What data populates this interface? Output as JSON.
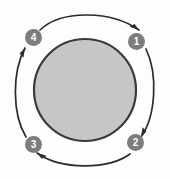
{
  "diagram": {
    "type": "cyclical-process-diagram",
    "title": "",
    "background_color": "#fdfdfd",
    "center": {
      "shape": "circle",
      "label": "",
      "fill_color": "#c6c6c6",
      "stroke_color": "#3a3a3a",
      "cx": 85,
      "cy": 90,
      "r": 51
    },
    "badge_style": {
      "fill_color": "#7d7d7d",
      "text_color": "#ffffff",
      "diameter": 17
    },
    "arrow_color": "#2b2b2b",
    "steps": [
      {
        "id": "step-1",
        "label": "1",
        "position": "right-top",
        "cx": 136.5,
        "cy": 41.5
      },
      {
        "id": "step-2",
        "label": "2",
        "position": "right-bottom",
        "cx": 135.5,
        "cy": 142.5
      },
      {
        "id": "step-3",
        "label": "3",
        "position": "left-bottom",
        "cx": 33.5,
        "cy": 144.5
      },
      {
        "id": "step-4",
        "label": "4",
        "position": "left-top",
        "cx": 33.5,
        "cy": 37.5
      }
    ],
    "arrows": [
      {
        "id": "arrow-4-to-1",
        "from": "step-4",
        "to": "step-1",
        "side": "top",
        "direction": "clockwise"
      },
      {
        "id": "arrow-1-to-2",
        "from": "step-1",
        "to": "step-2",
        "side": "right",
        "direction": "clockwise"
      },
      {
        "id": "arrow-2-to-3",
        "from": "step-2",
        "to": "step-3",
        "side": "bottom",
        "direction": "clockwise"
      },
      {
        "id": "arrow-3-to-4",
        "from": "step-3",
        "to": "step-4",
        "side": "left",
        "direction": "clockwise"
      }
    ]
  }
}
